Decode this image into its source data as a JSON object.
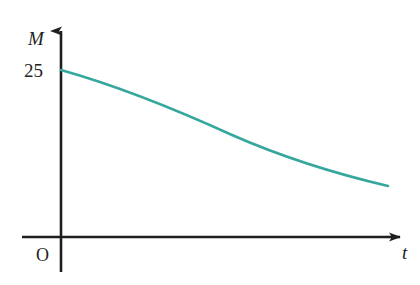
{
  "figure": {
    "background_color": "#ffffff",
    "axis_color": "#201f1f",
    "curve_color": "#35a79c",
    "width": 420,
    "height": 285
  },
  "labels": {
    "y_axis": "M",
    "x_axis": "t",
    "origin": "O",
    "y_intercept_tick": "25"
  },
  "chart_data": {
    "type": "line",
    "title": "",
    "xlabel": "t",
    "ylabel": "M",
    "grid": false,
    "legend": null,
    "annotations": [
      {
        "text": "O",
        "role": "origin-marker"
      },
      {
        "text": "25",
        "role": "y-axis-tick",
        "value": 25
      }
    ],
    "axis_style": "arrow-headed-rays",
    "xlim": [
      0,
      34
    ],
    "ylim": [
      0,
      30
    ],
    "xticks": [],
    "yticks": [
      25
    ],
    "ytick_labels": [
      "25"
    ],
    "series": [
      {
        "name": "M(t)",
        "color": "#35a79c",
        "description": "decreasing exponential decay curve starting at M = 25 when t = 0",
        "x": [
          0,
          2,
          4,
          6,
          8,
          10,
          12,
          14,
          16,
          18,
          20,
          22,
          24,
          26,
          28,
          30,
          32,
          34
        ],
        "y": [
          25.0,
          23.4,
          22.0,
          20.7,
          19.5,
          18.4,
          17.4,
          16.5,
          15.6,
          14.8,
          14.1,
          13.4,
          12.8,
          12.2,
          11.7,
          11.2,
          10.7,
          10.3
        ]
      }
    ]
  },
  "geometry": {
    "y_axis_x": 61,
    "x_axis_y": 237,
    "y_axis_top": 31,
    "y_axis_bottom": 272,
    "x_axis_left": 22,
    "x_axis_right": 400,
    "curve_start": {
      "x": 61,
      "y": 70
    },
    "curve_end": {
      "x": 388,
      "y": 186
    },
    "curve_path": "M 61 70 C 118 86, 175 109, 232 135 C 289 160, 341 175, 388 186"
  }
}
